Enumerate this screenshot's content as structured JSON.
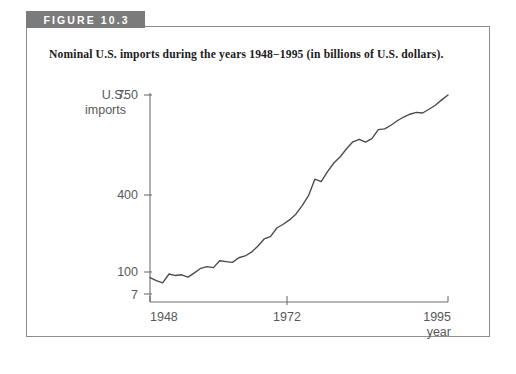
{
  "figure": {
    "tab_label": "FIGURE 10.3",
    "caption": "Nominal U.S. imports during the years 1948−1995 (in billions of U.S. dollars)."
  },
  "colors": {
    "tab_background": "#7b7b7b",
    "tab_text": "#ffffff",
    "frame_border": "#8d8d8d",
    "axis": "#6f6f72",
    "data_line": "#4a4a4c",
    "label_text": "#58585a",
    "caption_text": "#1b1b1b",
    "page_background": "#ffffff"
  },
  "chart_data": {
    "type": "line",
    "title": "Nominal U.S. imports during the years 1948−1995 (in billions of U.S. dollars).",
    "xlabel": "year",
    "ylabel": "U.S. imports",
    "yscale": "log",
    "ylim": [
      7,
      750
    ],
    "xlim": [
      1948,
      1995
    ],
    "grid": false,
    "legend": null,
    "ytick_labels": [
      "750",
      "400",
      "100",
      "7"
    ],
    "ytick_values": [
      750,
      400,
      100,
      7
    ],
    "xtick_labels": [
      "1948",
      "1972",
      "1995"
    ],
    "xtick_values": [
      1948,
      1972,
      1995
    ],
    "x": [
      1948,
      1949,
      1950,
      1951,
      1952,
      1953,
      1954,
      1955,
      1956,
      1957,
      1958,
      1959,
      1960,
      1961,
      1962,
      1963,
      1964,
      1965,
      1966,
      1967,
      1968,
      1969,
      1970,
      1971,
      1972,
      1973,
      1974,
      1975,
      1976,
      1977,
      1978,
      1979,
      1980,
      1981,
      1982,
      1983,
      1984,
      1985,
      1986,
      1987,
      1988,
      1989,
      1990,
      1991,
      1992,
      1993,
      1994,
      1995
    ],
    "values": [
      10.3,
      9.6,
      9.1,
      11.2,
      10.8,
      11.0,
      10.4,
      11.5,
      12.8,
      13.3,
      13.0,
      15.3,
      15.0,
      14.7,
      16.4,
      17.1,
      18.7,
      21.5,
      25.5,
      26.9,
      33.0,
      36.0,
      39.9,
      45.6,
      55.8,
      70.5,
      103.8,
      98.2,
      124.2,
      151.9,
      176.0,
      212.0,
      249.8,
      265.1,
      247.6,
      268.9,
      332.4,
      338.1,
      368.4,
      409.8,
      447.2,
      477.4,
      498.3,
      491.0,
      536.5,
      589.4,
      668.6,
      749.4
    ]
  }
}
